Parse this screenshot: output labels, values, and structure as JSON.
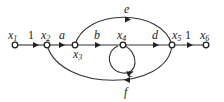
{
  "diagram": {
    "type": "signal-flow-graph",
    "nodes": [
      {
        "id": "x1",
        "label": "x",
        "sub": "1"
      },
      {
        "id": "x2",
        "label": "x",
        "sub": "2"
      },
      {
        "id": "x3",
        "label": "x",
        "sub": "3"
      },
      {
        "id": "x4",
        "label": "x",
        "sub": "4"
      },
      {
        "id": "x5",
        "label": "x",
        "sub": "5"
      },
      {
        "id": "x6",
        "label": "x",
        "sub": "6"
      }
    ],
    "edges": [
      {
        "from": "x1",
        "to": "x2",
        "gain": "1"
      },
      {
        "from": "x2",
        "to": "x3",
        "gain": "a"
      },
      {
        "from": "x3",
        "to": "x4",
        "gain": "b"
      },
      {
        "from": "x4",
        "to": "x4",
        "gain": "c"
      },
      {
        "from": "x4",
        "to": "x5",
        "gain": "d"
      },
      {
        "from": "x3",
        "to": "x5",
        "gain": "e"
      },
      {
        "from": "x5",
        "to": "x2",
        "gain": "f"
      },
      {
        "from": "x5",
        "to": "x6",
        "gain": "1"
      }
    ]
  }
}
